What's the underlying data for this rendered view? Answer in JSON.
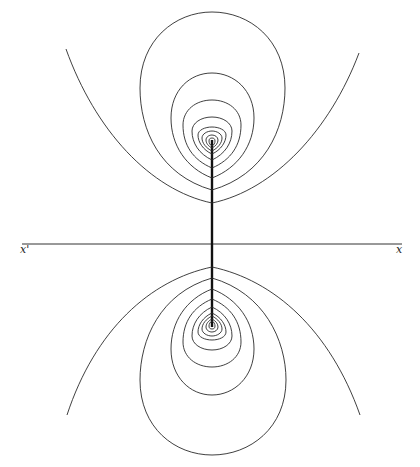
{
  "figure": {
    "axis_labels": {
      "left": "x'",
      "right": "x"
    },
    "colors": {
      "ink": "#2a2a2a",
      "background": "#ffffff"
    },
    "geometry": {
      "axis_y": 244,
      "center_x": 212,
      "upper_focus_y": 140,
      "lower_focus_y": 327,
      "upper_parabola_vertex_y": 203,
      "lower_parabola_vertex_y": 267
    }
  }
}
